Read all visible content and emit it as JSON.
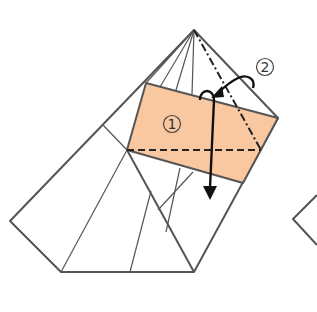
{
  "diagram": {
    "type": "origami-fold-diagram",
    "colors": {
      "paper_colored_side": "#F9C8A1",
      "line": "#555555",
      "fold_line": "#222222",
      "arrow": "#111111",
      "background": "#FFFFFF"
    },
    "steps": [
      {
        "id": "step-1",
        "label": "1",
        "symbol": "①",
        "fold": "valley-fold",
        "description": "Fold the colored flap down along the dashed valley line"
      },
      {
        "id": "step-2",
        "label": "2",
        "symbol": "②",
        "fold": "mountain-fold",
        "description": "Fold along the dash-dot mountain line behind"
      }
    ]
  }
}
